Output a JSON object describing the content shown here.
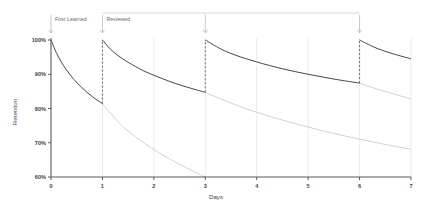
{
  "chart_data": {
    "type": "line",
    "title": "",
    "xlabel": "Days",
    "ylabel": "Retention",
    "xlim": [
      0,
      7
    ],
    "ylim": [
      60,
      100
    ],
    "grid": true,
    "legend_position": "none",
    "x_ticks": [
      "0",
      "1",
      "2",
      "3",
      "4",
      "5",
      "6",
      "7"
    ],
    "y_ticks": [
      "60%",
      "70%",
      "80%",
      "90%",
      "100%"
    ],
    "annotations": [
      {
        "label": "First Learned",
        "x": 0
      },
      {
        "label": "Reviewed",
        "x": 1
      }
    ],
    "review_days": [
      1,
      3,
      6
    ],
    "series": [
      {
        "name": "Retention with review 1",
        "kind": "main",
        "x": [
          0.0,
          0.1,
          0.2,
          0.3,
          0.45,
          0.6,
          0.8,
          1.0
        ],
        "y": [
          100.0,
          96.4,
          93.6,
          91.3,
          88.4,
          86.1,
          83.5,
          81.4
        ]
      },
      {
        "name": "Retention with review 2",
        "kind": "main",
        "x": [
          1.0,
          1.15,
          1.3,
          1.5,
          1.8,
          2.1,
          2.4,
          2.7,
          3.0
        ],
        "y": [
          100.0,
          97.4,
          95.5,
          93.5,
          91.0,
          89.1,
          87.4,
          86.0,
          84.7
        ]
      },
      {
        "name": "Retention with review 3",
        "kind": "main",
        "x": [
          3.0,
          3.3,
          3.6,
          4.0,
          4.5,
          5.0,
          5.5,
          6.0
        ],
        "y": [
          100.0,
          97.4,
          95.5,
          93.6,
          91.6,
          90.0,
          88.6,
          87.4
        ]
      },
      {
        "name": "Retention with review 4",
        "kind": "main",
        "x": [
          6.0,
          6.3,
          6.6,
          7.0
        ],
        "y": [
          100.0,
          97.8,
          96.2,
          94.5
        ]
      },
      {
        "name": "Forgetting without review 1",
        "kind": "ghost",
        "x": [
          1.0,
          1.3,
          1.6,
          2.0,
          2.4,
          2.7,
          3.0
        ],
        "y": [
          81.4,
          76.2,
          72.2,
          68.0,
          64.5,
          62.2,
          60.0
        ]
      },
      {
        "name": "Forgetting without review 2",
        "kind": "ghost",
        "x": [
          3.0,
          3.5,
          4.0,
          4.6,
          5.2,
          5.8,
          6.4,
          7.0
        ],
        "y": [
          84.7,
          81.6,
          78.9,
          76.2,
          73.8,
          71.7,
          69.8,
          68.1
        ]
      },
      {
        "name": "Forgetting without review 3",
        "kind": "ghost",
        "x": [
          6.0,
          6.4,
          7.0
        ],
        "y": [
          87.4,
          85.4,
          82.8
        ]
      }
    ]
  }
}
